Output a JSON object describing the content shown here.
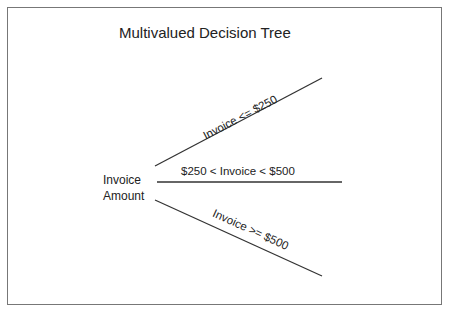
{
  "diagram": {
    "title": "Multivalued Decision Tree",
    "root": {
      "line1": "Invoice",
      "line2": "Amount"
    },
    "branches": [
      {
        "label": "Invoice <= $250"
      },
      {
        "label": "$250 < Invoice < $500"
      },
      {
        "label": "Invoice >= $500"
      }
    ],
    "colors": {
      "line": "#333333",
      "text": "#222222",
      "border": "#777777"
    }
  }
}
